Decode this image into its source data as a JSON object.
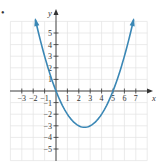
{
  "chart_data": {
    "type": "line",
    "title": "",
    "xlabel": "x",
    "ylabel": "y",
    "xlim": [
      -4,
      8
    ],
    "ylim": [
      -6,
      6
    ],
    "grid": true,
    "x_ticks": [
      -3,
      -2,
      -1,
      1,
      2,
      3,
      4,
      5,
      6,
      7
    ],
    "y_ticks": [
      -5,
      -4,
      -3,
      -2,
      -1,
      1,
      2,
      3,
      4,
      5
    ],
    "x_tick_labels": [
      "−3",
      "−2",
      "−1",
      "1",
      "2",
      "3",
      "4",
      "5",
      "6",
      "7"
    ],
    "y_tick_labels": [
      "−5",
      "−4",
      "−3",
      "−2",
      "−1",
      "1",
      "2",
      "3",
      "4",
      "5"
    ],
    "series": [
      {
        "name": "parabola",
        "equation": "y = 0.5x^2 - 2.5x",
        "color": "#3a87b5",
        "arrows_both_ends": true,
        "x": [
          -1.8,
          -1.5,
          -1,
          -0.5,
          0,
          0.5,
          1,
          1.5,
          2,
          2.5,
          3,
          3.5,
          4,
          4.5,
          5,
          5.5,
          6,
          6.5,
          6.8
        ],
        "y": [
          6.12,
          4.875,
          3,
          1.375,
          0,
          -1.125,
          -2,
          -2.625,
          -3,
          -3.125,
          -3,
          -2.625,
          -2,
          -1.125,
          0,
          1.375,
          3,
          4.875,
          6.12
        ]
      }
    ],
    "key_points": {
      "x_intercepts": [
        0,
        5
      ],
      "vertex": [
        2.5,
        -3.125
      ]
    }
  },
  "bullet": "•",
  "colors": {
    "curve": "#3a87b5",
    "axis": "#333333",
    "grid": "#e2e2e2"
  }
}
